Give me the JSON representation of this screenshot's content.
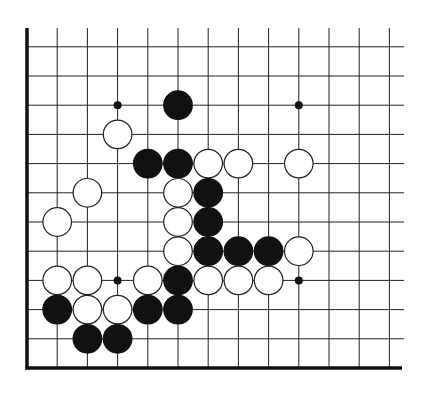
{
  "game": "go",
  "board": {
    "title": "",
    "visible_columns": 13,
    "visible_rows": 12,
    "edges": [
      "left",
      "bottom"
    ],
    "colors": {
      "background": "#ffffff",
      "line": "#222222",
      "edge": "#111111",
      "black_stone": "#111111",
      "white_stone": "#ffffff",
      "white_stone_outline": "#222222",
      "hoshi": "#111111"
    }
  },
  "hoshi": [
    {
      "col": 3,
      "row": 9
    },
    {
      "col": 9,
      "row": 9
    },
    {
      "col": 3,
      "row": 3
    },
    {
      "col": 9,
      "row": 3
    }
  ],
  "stones": [
    {
      "color": "black",
      "col": 5,
      "row": 9
    },
    {
      "color": "white",
      "col": 3,
      "row": 8
    },
    {
      "color": "black",
      "col": 4,
      "row": 7
    },
    {
      "color": "black",
      "col": 5,
      "row": 7
    },
    {
      "color": "white",
      "col": 6,
      "row": 7
    },
    {
      "color": "white",
      "col": 7,
      "row": 7
    },
    {
      "color": "white",
      "col": 9,
      "row": 7
    },
    {
      "color": "white",
      "col": 2,
      "row": 6
    },
    {
      "color": "white",
      "col": 5,
      "row": 6
    },
    {
      "color": "black",
      "col": 6,
      "row": 6
    },
    {
      "color": "white",
      "col": 1,
      "row": 5
    },
    {
      "color": "white",
      "col": 5,
      "row": 5
    },
    {
      "color": "black",
      "col": 6,
      "row": 5
    },
    {
      "color": "white",
      "col": 5,
      "row": 4
    },
    {
      "color": "black",
      "col": 6,
      "row": 4
    },
    {
      "color": "black",
      "col": 7,
      "row": 4
    },
    {
      "color": "black",
      "col": 8,
      "row": 4
    },
    {
      "color": "white",
      "col": 9,
      "row": 4
    },
    {
      "color": "white",
      "col": 1,
      "row": 3
    },
    {
      "color": "white",
      "col": 2,
      "row": 3
    },
    {
      "color": "white",
      "col": 4,
      "row": 3
    },
    {
      "color": "black",
      "col": 5,
      "row": 3
    },
    {
      "color": "white",
      "col": 6,
      "row": 3
    },
    {
      "color": "white",
      "col": 7,
      "row": 3
    },
    {
      "color": "white",
      "col": 8,
      "row": 3
    },
    {
      "color": "black",
      "col": 1,
      "row": 2
    },
    {
      "color": "white",
      "col": 2,
      "row": 2
    },
    {
      "color": "white",
      "col": 3,
      "row": 2
    },
    {
      "color": "black",
      "col": 4,
      "row": 2
    },
    {
      "color": "black",
      "col": 5,
      "row": 2
    },
    {
      "color": "black",
      "col": 2,
      "row": 1
    },
    {
      "color": "black",
      "col": 3,
      "row": 1
    }
  ]
}
